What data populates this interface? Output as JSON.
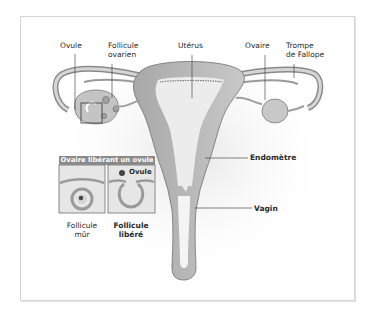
{
  "diagram": {
    "labels": {
      "ovule": "Ovule",
      "follicule_ovarien_line1": "Follicule",
      "follicule_ovarien_line2": "ovarien",
      "uterus": "Utérus",
      "ovaire": "Ovaire",
      "trompe_line1": "Trompe",
      "trompe_line2": "de Fallope",
      "endometre": "Endomètre",
      "vagin": "Vagin"
    },
    "inset": {
      "title": "Ovaire libérant un ovule",
      "panel_right_label": "Ovule",
      "caption_left_line1": "Follicule",
      "caption_left_line2": "mûr",
      "caption_right_line1": "Follicule",
      "caption_right_line2": "libéré"
    },
    "colors": {
      "tissue_dark": "#9a9a9a",
      "tissue_mid": "#bdbdbd",
      "tissue_light": "#d9d9d9",
      "cavity": "#eeeeee",
      "outline": "#6e6e6e",
      "inset_header": "#8a8a8a"
    }
  }
}
